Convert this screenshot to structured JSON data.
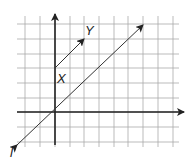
{
  "diagram": {
    "type": "coordinate-grid",
    "grid": {
      "x_lines": [
        25,
        40,
        55,
        70,
        84,
        99,
        114,
        128,
        143,
        158,
        173
      ],
      "y_lines": [
        24,
        39,
        54,
        68,
        83,
        98,
        112,
        127,
        142
      ],
      "color": "#aaaaaa"
    },
    "axes": {
      "color": "#222222",
      "origin": [
        55,
        112
      ],
      "x_axis": {
        "from": [
          17,
          112
        ],
        "to": [
          184,
          112
        ]
      },
      "y_axis": {
        "from": [
          55,
          145
        ],
        "to": [
          55,
          14
        ]
      }
    },
    "line_l": {
      "label": "l",
      "from": [
        17,
        145
      ],
      "to": [
        143,
        25
      ],
      "label_pos": [
        10,
        146
      ],
      "description": "line through origin with slope 1, arrows at both ends"
    },
    "segment_xy": {
      "start_label": "X",
      "end_label": "Y",
      "from": [
        55,
        68
      ],
      "to": [
        84,
        39
      ],
      "start_label_pos": [
        57,
        72
      ],
      "end_label_pos": [
        85,
        24
      ],
      "grid_from": [
        0,
        3
      ],
      "grid_to": [
        2,
        5
      ],
      "description": "directed segment from X to Y, parallel to line l"
    },
    "labels": {
      "l": "l",
      "X": "X",
      "Y": "Y"
    }
  }
}
